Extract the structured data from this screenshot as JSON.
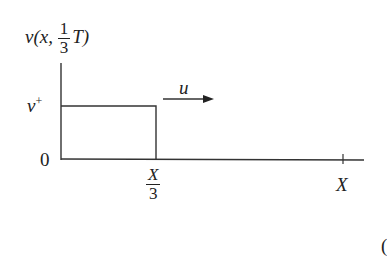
{
  "diagram": {
    "ylabel": {
      "func": "v",
      "open": "(x, ",
      "frac_num": "1",
      "frac_den": "3",
      "tail": "T)"
    },
    "level_label": {
      "base": "v",
      "sup": "+"
    },
    "origin_label": "0",
    "velocity_label": "u",
    "tick_x3": {
      "num": "X",
      "den": "3"
    },
    "tick_x": "X",
    "partial_glyph": "("
  },
  "colors": {
    "line": "#333333",
    "text": "#222222"
  }
}
